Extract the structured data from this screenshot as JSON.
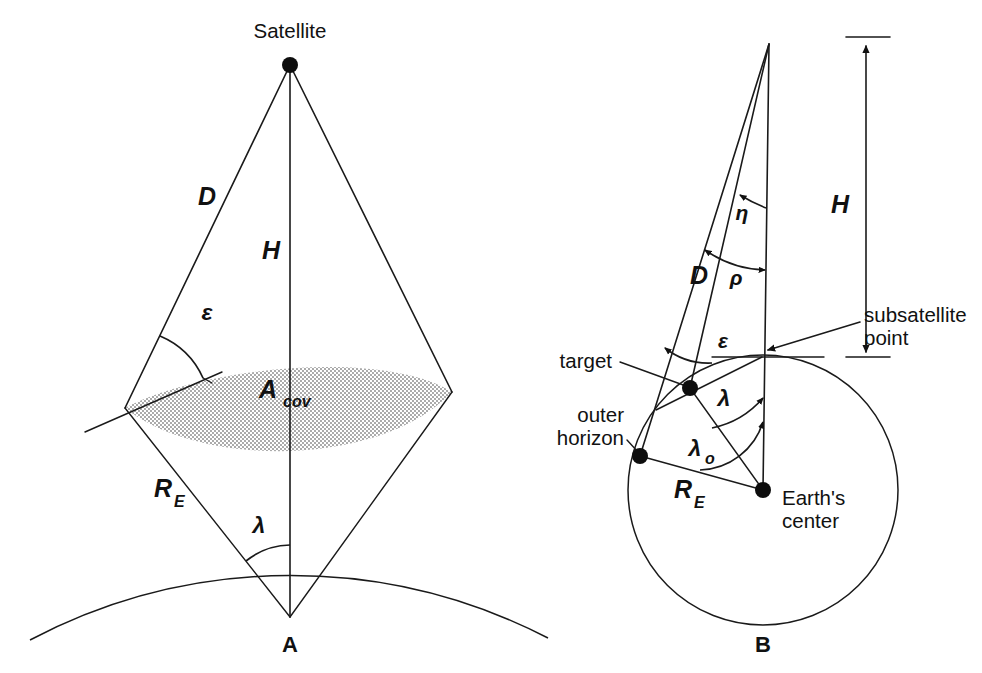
{
  "figure": {
    "panels": [
      {
        "id": "A",
        "label": "A",
        "caption": "Satellite coverage cone and coverage area"
      },
      {
        "id": "B",
        "label": "B",
        "caption": "Satellite to Earth angular relationships"
      }
    ]
  },
  "panel_a": {
    "label": "A",
    "satellite_label": "Satellite",
    "slant_range_label": "D",
    "altitude_label": "H",
    "elevation_label": "ε",
    "coverage_label_main": "A",
    "coverage_label_sub": "cov",
    "earth_radius_label": "R",
    "earth_radius_sub": "E",
    "earth_central_angle_label": "λ"
  },
  "panel_b": {
    "label": "B",
    "altitude_label": "H",
    "slant_range_label": "D",
    "nadir_angle_label": "η",
    "rho_label": "ρ",
    "elevation_label": "ε",
    "earth_central_angle_label": "λ",
    "horizon_angle_label": "λ",
    "horizon_angle_sub": "o",
    "earth_radius_label": "R",
    "earth_radius_sub": "E",
    "subsatellite_label_line1": "subsatellite",
    "subsatellite_label_line2": "point",
    "target_label": "target",
    "outer_horizon_line1": "outer",
    "outer_horizon_line2": "horizon",
    "earth_center_line1": "Earth's",
    "earth_center_line2": "center"
  },
  "colors": {
    "ink": "#111111",
    "background": "#ffffff",
    "stipple": "#2b2b2b"
  }
}
